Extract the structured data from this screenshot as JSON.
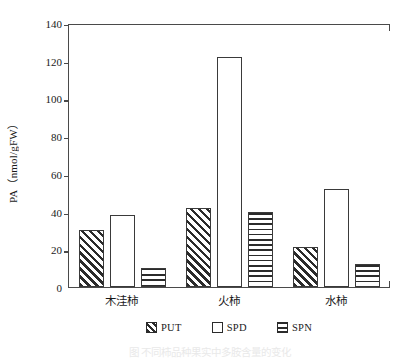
{
  "chart_data": {
    "type": "bar",
    "title": "",
    "subtitle": "",
    "xlabel": "",
    "ylabel": "PA（nmol/gFW）",
    "categories": [
      "木洼柿",
      "火柿",
      "水柿"
    ],
    "series": [
      {
        "name": "PUT",
        "values": [
          30,
          42,
          21
        ],
        "pattern": "diagonal-hatch"
      },
      {
        "name": "SPD",
        "values": [
          38,
          122,
          52
        ],
        "pattern": "blank"
      },
      {
        "name": "SPN",
        "values": [
          10,
          40,
          12
        ],
        "pattern": "horizontal-hatch"
      }
    ],
    "ylim": [
      0,
      140
    ],
    "yticks": [
      0,
      20,
      40,
      60,
      80,
      100,
      120,
      140
    ],
    "ytick_labels": [
      "0",
      "20",
      "40",
      "60",
      "80",
      "100",
      "120",
      "140"
    ],
    "grid": false,
    "legend_position": "bottom-center",
    "frame": "left-top-bottom",
    "colors": {
      "axis": "#4a4a4a",
      "bar_outline": "#3a3a3a",
      "hatch": "#2b2b2b",
      "bar_fill": "#ffffff",
      "background": "#ffffff",
      "text": "#1a1a1a"
    }
  },
  "legend": {
    "items": [
      {
        "label": "PUT",
        "pattern": "diagonal-hatch"
      },
      {
        "label": "SPD",
        "pattern": "blank"
      },
      {
        "label": "SPN",
        "pattern": "horizontal-hatch"
      }
    ]
  },
  "caption": {
    "text": "图   不同柿品种果实中多胺含量的变化"
  }
}
